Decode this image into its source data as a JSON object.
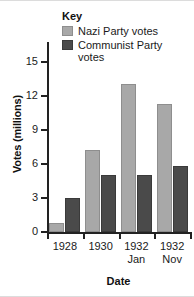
{
  "chart_data": {
    "type": "bar",
    "title": "",
    "categories": [
      "1928",
      "1930",
      "1932 Jan",
      "1932 Nov"
    ],
    "category_lines": [
      {
        "line1": "1928",
        "line2": ""
      },
      {
        "line1": "1930",
        "line2": ""
      },
      {
        "line1": "1932",
        "line2": "Jan"
      },
      {
        "line1": "1932",
        "line2": "Nov"
      }
    ],
    "series": [
      {
        "name": "Nazi Party votes",
        "color": "#a8a8a8",
        "values": [
          0.8,
          7.2,
          13.1,
          11.3
        ]
      },
      {
        "name": "Communist Party votes",
        "color": "#4a4a4a",
        "values": [
          3.0,
          5.0,
          5.0,
          5.8
        ]
      }
    ],
    "xlabel": "Date",
    "ylabel": "Votes (millions)",
    "ylim": [
      0,
      16.9
    ],
    "yticks": [
      0,
      3,
      6,
      9,
      12,
      15
    ],
    "ytick_labels": [
      "0",
      "3",
      "6",
      "9",
      "12",
      "15"
    ],
    "grid": false,
    "legend_position": "top-right",
    "legend_title": "Key"
  },
  "legend": {
    "title": "Key",
    "items": [
      {
        "label": "Nazi Party votes",
        "color": "#a8a8a8"
      },
      {
        "label": "Communist Party votes",
        "color": "#4a4a4a"
      }
    ]
  },
  "axes": {
    "y_title": "Votes (millions)",
    "x_title": "Date"
  }
}
